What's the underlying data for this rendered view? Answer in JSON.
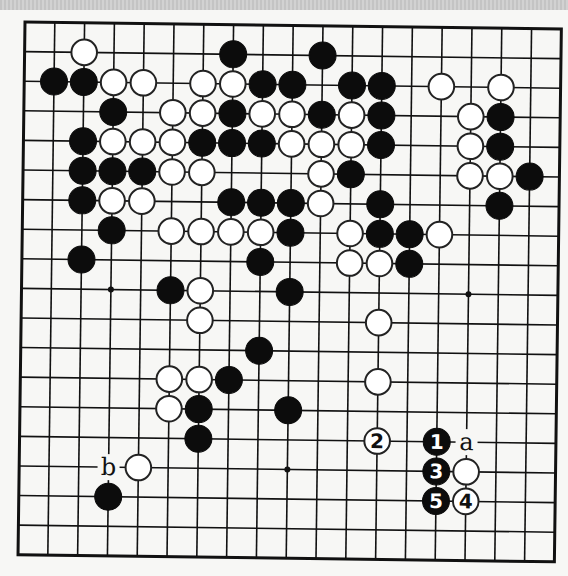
{
  "diagram": {
    "type": "go-board",
    "size": 19,
    "colors": {
      "background": "#f7f7f5",
      "lines": "#111111",
      "black": "#0c0c0c",
      "white": "#ffffff"
    },
    "star_points": [
      [
        3,
        3
      ],
      [
        3,
        9
      ],
      [
        3,
        15
      ],
      [
        9,
        3
      ],
      [
        9,
        9
      ],
      [
        9,
        15
      ],
      [
        15,
        3
      ],
      [
        15,
        9
      ],
      [
        15,
        15
      ]
    ],
    "stones": [
      {
        "row": 1,
        "col": 2,
        "color": "white"
      },
      {
        "row": 1,
        "col": 7,
        "color": "black"
      },
      {
        "row": 1,
        "col": 10,
        "color": "black"
      },
      {
        "row": 2,
        "col": 1,
        "color": "black"
      },
      {
        "row": 2,
        "col": 2,
        "color": "black"
      },
      {
        "row": 2,
        "col": 3,
        "color": "white"
      },
      {
        "row": 2,
        "col": 4,
        "color": "white"
      },
      {
        "row": 2,
        "col": 6,
        "color": "white"
      },
      {
        "row": 2,
        "col": 7,
        "color": "white"
      },
      {
        "row": 2,
        "col": 8,
        "color": "black"
      },
      {
        "row": 2,
        "col": 9,
        "color": "black"
      },
      {
        "row": 2,
        "col": 11,
        "color": "black"
      },
      {
        "row": 2,
        "col": 12,
        "color": "black"
      },
      {
        "row": 2,
        "col": 14,
        "color": "white"
      },
      {
        "row": 2,
        "col": 16,
        "color": "white"
      },
      {
        "row": 3,
        "col": 3,
        "color": "black"
      },
      {
        "row": 3,
        "col": 5,
        "color": "white"
      },
      {
        "row": 3,
        "col": 6,
        "color": "white"
      },
      {
        "row": 3,
        "col": 7,
        "color": "black"
      },
      {
        "row": 3,
        "col": 8,
        "color": "white"
      },
      {
        "row": 3,
        "col": 9,
        "color": "white"
      },
      {
        "row": 3,
        "col": 10,
        "color": "black"
      },
      {
        "row": 3,
        "col": 11,
        "color": "white"
      },
      {
        "row": 3,
        "col": 12,
        "color": "black"
      },
      {
        "row": 3,
        "col": 15,
        "color": "white"
      },
      {
        "row": 3,
        "col": 16,
        "color": "black"
      },
      {
        "row": 4,
        "col": 2,
        "color": "black"
      },
      {
        "row": 4,
        "col": 3,
        "color": "white"
      },
      {
        "row": 4,
        "col": 4,
        "color": "white"
      },
      {
        "row": 4,
        "col": 5,
        "color": "white"
      },
      {
        "row": 4,
        "col": 6,
        "color": "black"
      },
      {
        "row": 4,
        "col": 7,
        "color": "black"
      },
      {
        "row": 4,
        "col": 8,
        "color": "black"
      },
      {
        "row": 4,
        "col": 9,
        "color": "white"
      },
      {
        "row": 4,
        "col": 10,
        "color": "white"
      },
      {
        "row": 4,
        "col": 11,
        "color": "white"
      },
      {
        "row": 4,
        "col": 12,
        "color": "black"
      },
      {
        "row": 4,
        "col": 15,
        "color": "white"
      },
      {
        "row": 4,
        "col": 16,
        "color": "black"
      },
      {
        "row": 5,
        "col": 2,
        "color": "black"
      },
      {
        "row": 5,
        "col": 3,
        "color": "black"
      },
      {
        "row": 5,
        "col": 4,
        "color": "black"
      },
      {
        "row": 5,
        "col": 5,
        "color": "white"
      },
      {
        "row": 5,
        "col": 6,
        "color": "white"
      },
      {
        "row": 5,
        "col": 10,
        "color": "white"
      },
      {
        "row": 5,
        "col": 11,
        "color": "black"
      },
      {
        "row": 5,
        "col": 15,
        "color": "white"
      },
      {
        "row": 5,
        "col": 16,
        "color": "white"
      },
      {
        "row": 5,
        "col": 17,
        "color": "black"
      },
      {
        "row": 6,
        "col": 2,
        "color": "black"
      },
      {
        "row": 6,
        "col": 3,
        "color": "white"
      },
      {
        "row": 6,
        "col": 4,
        "color": "white"
      },
      {
        "row": 6,
        "col": 7,
        "color": "black"
      },
      {
        "row": 6,
        "col": 8,
        "color": "black"
      },
      {
        "row": 6,
        "col": 9,
        "color": "black"
      },
      {
        "row": 6,
        "col": 10,
        "color": "white"
      },
      {
        "row": 6,
        "col": 12,
        "color": "black"
      },
      {
        "row": 6,
        "col": 16,
        "color": "black"
      },
      {
        "row": 7,
        "col": 3,
        "color": "black"
      },
      {
        "row": 7,
        "col": 5,
        "color": "white"
      },
      {
        "row": 7,
        "col": 6,
        "color": "white"
      },
      {
        "row": 7,
        "col": 7,
        "color": "white"
      },
      {
        "row": 7,
        "col": 8,
        "color": "white"
      },
      {
        "row": 7,
        "col": 9,
        "color": "black"
      },
      {
        "row": 7,
        "col": 11,
        "color": "white"
      },
      {
        "row": 7,
        "col": 12,
        "color": "black"
      },
      {
        "row": 7,
        "col": 13,
        "color": "black"
      },
      {
        "row": 7,
        "col": 14,
        "color": "white"
      },
      {
        "row": 8,
        "col": 2,
        "color": "black"
      },
      {
        "row": 8,
        "col": 8,
        "color": "black"
      },
      {
        "row": 8,
        "col": 11,
        "color": "white"
      },
      {
        "row": 8,
        "col": 12,
        "color": "white"
      },
      {
        "row": 8,
        "col": 13,
        "color": "black"
      },
      {
        "row": 9,
        "col": 5,
        "color": "black"
      },
      {
        "row": 9,
        "col": 6,
        "color": "white"
      },
      {
        "row": 9,
        "col": 9,
        "color": "black"
      },
      {
        "row": 10,
        "col": 6,
        "color": "white"
      },
      {
        "row": 10,
        "col": 12,
        "color": "white"
      },
      {
        "row": 11,
        "col": 8,
        "color": "black"
      },
      {
        "row": 12,
        "col": 5,
        "color": "white"
      },
      {
        "row": 12,
        "col": 6,
        "color": "white"
      },
      {
        "row": 12,
        "col": 7,
        "color": "black"
      },
      {
        "row": 12,
        "col": 12,
        "color": "white"
      },
      {
        "row": 13,
        "col": 5,
        "color": "white"
      },
      {
        "row": 13,
        "col": 6,
        "color": "black"
      },
      {
        "row": 13,
        "col": 9,
        "color": "black"
      },
      {
        "row": 14,
        "col": 6,
        "color": "black"
      },
      {
        "row": 14,
        "col": 12,
        "color": "white",
        "move": "2"
      },
      {
        "row": 14,
        "col": 14,
        "color": "black",
        "move": "1"
      },
      {
        "row": 15,
        "col": 4,
        "color": "white"
      },
      {
        "row": 15,
        "col": 14,
        "color": "black",
        "move": "3"
      },
      {
        "row": 15,
        "col": 15,
        "color": "white"
      },
      {
        "row": 16,
        "col": 3,
        "color": "black"
      },
      {
        "row": 16,
        "col": 14,
        "color": "black",
        "move": "5"
      },
      {
        "row": 16,
        "col": 15,
        "color": "white",
        "move": "4"
      }
    ],
    "labels": [
      {
        "row": 14,
        "col": 15,
        "text": "a"
      },
      {
        "row": 15,
        "col": 3,
        "text": "b"
      }
    ]
  }
}
